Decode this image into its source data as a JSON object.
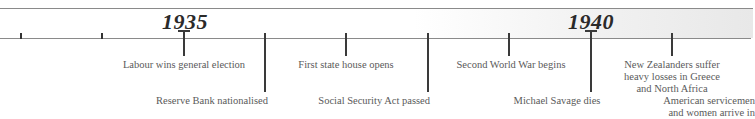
{
  "timeline": {
    "years": [
      {
        "label": "1935",
        "x": 185
      },
      {
        "label": "1940",
        "x": 591
      }
    ],
    "minor_ticks": [
      21,
      102,
      428,
      509
    ],
    "events": [
      {
        "text": "Labour wins general election",
        "x": 184,
        "length": "short"
      },
      {
        "text": "Reserve Bank nationalised",
        "x": 265,
        "length": "long"
      },
      {
        "text": "First state house opens",
        "x": 346,
        "length": "short"
      },
      {
        "text": "Social Security Act passed",
        "x": 428,
        "length": "long"
      },
      {
        "text": "Second World War begins",
        "x": 509,
        "length": "short"
      },
      {
        "text": "Michael Savage dies",
        "x": 591,
        "length": "long"
      },
      {
        "lines": [
          "New Zealanders suffer",
          "heavy losses in Greece",
          "and North Africa"
        ],
        "x": 672,
        "length": "short"
      },
      {
        "lines": [
          "American servicemen",
          "and women arrive in"
        ],
        "x": 753,
        "length": "long"
      }
    ]
  },
  "colors": {
    "line": "#3a3a3a",
    "text": "#5a5a5a",
    "year": "#2a2a2a",
    "band_end": "#e8e8e8"
  }
}
